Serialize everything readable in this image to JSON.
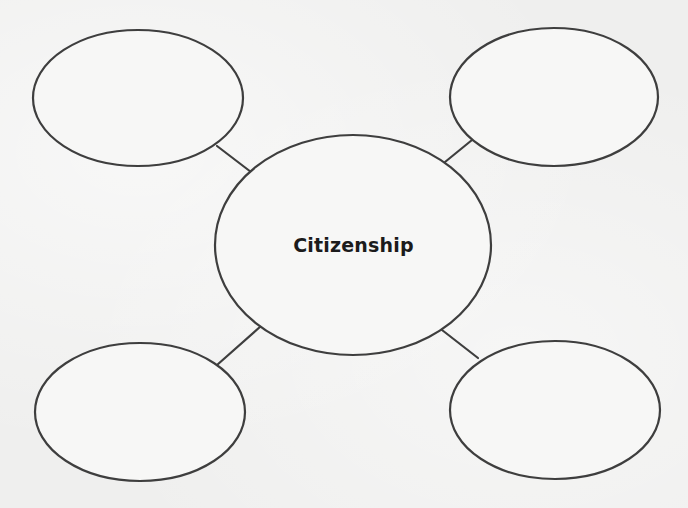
{
  "diagram": {
    "type": "concept-web",
    "center": {
      "label": "Citizenship",
      "cx": 353,
      "cy": 245,
      "rx": 138,
      "ry": 110
    },
    "nodes": [
      {
        "id": "top-left",
        "label": "",
        "cx": 138,
        "cy": 98,
        "rx": 105,
        "ry": 68
      },
      {
        "id": "top-right",
        "label": "",
        "cx": 554,
        "cy": 97,
        "rx": 104,
        "ry": 69
      },
      {
        "id": "bottom-left",
        "label": "",
        "cx": 140,
        "cy": 412,
        "rx": 105,
        "ry": 69
      },
      {
        "id": "bottom-right",
        "label": "",
        "cx": 555,
        "cy": 410,
        "rx": 105,
        "ry": 69
      }
    ],
    "connectors": [
      {
        "from": "top-left",
        "x1": 217,
        "y1": 146,
        "x2": 251,
        "y2": 172
      },
      {
        "from": "top-right",
        "x1": 472,
        "y1": 140,
        "x2": 445,
        "y2": 162
      },
      {
        "from": "bottom-left",
        "x1": 217,
        "y1": 365,
        "x2": 261,
        "y2": 326
      },
      {
        "from": "bottom-right",
        "x1": 478,
        "y1": 358,
        "x2": 442,
        "y2": 330
      }
    ],
    "colors": {
      "stroke": "#3e3e3e",
      "text": "#1b1b1b",
      "background": "#efefee"
    }
  }
}
